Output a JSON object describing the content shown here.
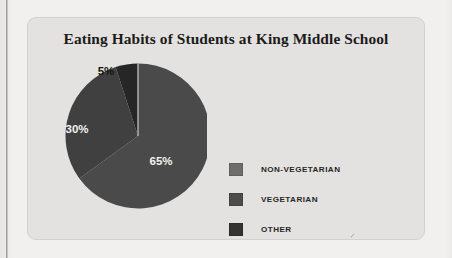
{
  "chart_data": {
    "type": "pie",
    "title": "Eating Habits of Students at King Middle School",
    "categories": [
      "NON-VEGETARIAN",
      "VEGETARIAN",
      "OTHER"
    ],
    "values": [
      65,
      30,
      5
    ],
    "labels": [
      "65%",
      "30%",
      "5%"
    ],
    "legend_position": "right",
    "start_angle_deg": 0,
    "direction": "clockwise",
    "colors": [
      "#4a4a4a",
      "#3f3f3f",
      "#2b2b2b"
    ],
    "legend_swatch_colors": [
      "#6d6d6d",
      "#4d4d4d",
      "#333333"
    ]
  },
  "card": {
    "title": "Eating Habits of Students at King Middle School"
  },
  "pie": {
    "slices": [
      {
        "name": "non-vegetarian",
        "label": "65%",
        "value": 65,
        "fill": "#4a4a4a",
        "label_color": "light",
        "label_x": 122,
        "label_y": 113
      },
      {
        "name": "vegetarian",
        "label": "30%",
        "value": 30,
        "fill": "#404040",
        "label_color": "light",
        "label_x": 38,
        "label_y": 81
      },
      {
        "name": "other",
        "label": "5%",
        "value": 5,
        "fill": "#262626",
        "label_color": "dark",
        "label_x": 67,
        "label_y": 23
      }
    ]
  },
  "legend": {
    "items": [
      {
        "label": "NON-VEGETARIAN",
        "color": "#6d6d6d"
      },
      {
        "label": "VEGETARIAN",
        "color": "#4d4d4d"
      },
      {
        "label": "OTHER",
        "color": "#333333"
      }
    ]
  }
}
